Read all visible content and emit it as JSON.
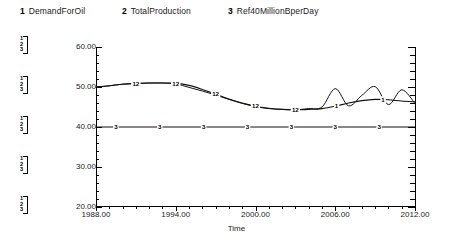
{
  "legend": {
    "entries": [
      {
        "num": "1",
        "label": "DemandForOil"
      },
      {
        "num": "2",
        "label": "TotalProduction"
      },
      {
        "num": "3",
        "label": "Ref40MillionBperDay"
      }
    ]
  },
  "scale_braces": [
    {
      "nums": [
        "1",
        "2",
        "3"
      ]
    },
    {
      "nums": [
        "1",
        "2",
        "3"
      ]
    },
    {
      "nums": [
        "1",
        "2",
        "3"
      ]
    },
    {
      "nums": [
        "1",
        "2",
        "3"
      ]
    },
    {
      "nums": [
        "1",
        "2",
        "3"
      ]
    }
  ],
  "axes": {
    "y_ticks": [
      "60.00",
      "50.00",
      "40.00",
      "30.00",
      "20.00"
    ],
    "x_ticks": [
      "1988.00",
      "1994.00",
      "2000.00",
      "2006.00",
      "2012.00"
    ],
    "x_title": "Time"
  },
  "chart_data": {
    "type": "line",
    "title": "",
    "xlabel": "Time",
    "ylabel": "",
    "xlim": [
      1988,
      2012
    ],
    "ylim": [
      20,
      60
    ],
    "grid": false,
    "legend_position": "top",
    "x": [
      1988,
      1989,
      1990,
      1991,
      1992,
      1993,
      1994,
      1995,
      1996,
      1997,
      1998,
      1999,
      2000,
      2001,
      2002,
      2003,
      2004,
      2005,
      2006,
      2007,
      2008,
      2009,
      2010,
      2011,
      2012
    ],
    "series": [
      {
        "name": "DemandForOil",
        "num": "1",
        "marker_label": "1",
        "values": [
          50.0,
          50.3,
          50.7,
          50.9,
          51.0,
          51.0,
          50.9,
          50.4,
          49.4,
          48.2,
          47.0,
          46.0,
          45.2,
          44.7,
          44.4,
          44.3,
          44.4,
          44.6,
          45.2,
          46.0,
          46.6,
          46.9,
          46.8,
          46.5,
          46.3
        ]
      },
      {
        "name": "TotalProduction",
        "num": "2",
        "marker_label": "2",
        "values": [
          50.0,
          50.3,
          50.7,
          50.9,
          51.0,
          51.0,
          50.8,
          49.9,
          49.0,
          48.0,
          46.9,
          45.9,
          45.1,
          44.6,
          44.4,
          44.3,
          44.6,
          45.0,
          49.6,
          45.3,
          47.9,
          50.1,
          45.6,
          49.3,
          45.9
        ]
      },
      {
        "name": "Ref40MillionBperDay",
        "num": "3",
        "marker_label": "3",
        "values": [
          40.0,
          40.0,
          40.0,
          40.0,
          40.0,
          40.0,
          40.0,
          40.0,
          40.0,
          40.0,
          40.0,
          40.0,
          40.0,
          40.0,
          40.0,
          40.0,
          40.0,
          40.0,
          40.0,
          40.0,
          40.0,
          40.0,
          40.0,
          40.0,
          40.0
        ]
      }
    ],
    "markers": {
      "combined_12": [
        {
          "x": 1991,
          "label": "12"
        },
        {
          "x": 1994,
          "label": "12"
        },
        {
          "x": 1997,
          "label": "12"
        },
        {
          "x": 2000,
          "label": "12"
        },
        {
          "x": 2003,
          "label": "12"
        }
      ],
      "series3": [
        {
          "x": 1989.5,
          "label": "3"
        },
        {
          "x": 1992.8,
          "label": "3"
        },
        {
          "x": 1996.1,
          "label": "3"
        },
        {
          "x": 1999.4,
          "label": "3"
        },
        {
          "x": 2002.7,
          "label": "3"
        },
        {
          "x": 2006.0,
          "label": "3"
        },
        {
          "x": 2009.3,
          "label": "3"
        }
      ],
      "series1_right": [
        {
          "x": 2006.1,
          "label": "1"
        },
        {
          "x": 2009.6,
          "label": "1"
        }
      ]
    }
  }
}
